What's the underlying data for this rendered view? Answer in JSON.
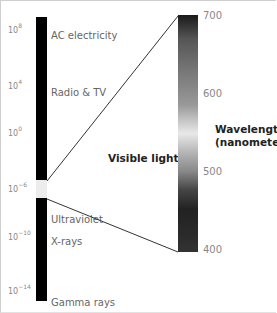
{
  "diagram": {
    "left_scale": {
      "ticks": [
        {
          "base": "10",
          "exp": "8"
        },
        {
          "base": "10",
          "exp": "4"
        },
        {
          "base": "10",
          "exp": "0"
        },
        {
          "base": "10",
          "exp": "−6"
        },
        {
          "base": "10",
          "exp": "−10"
        },
        {
          "base": "10",
          "exp": "−14"
        }
      ],
      "bands": [
        "AC electricity",
        "Radio & TV",
        "Ultraviolet",
        "X-rays",
        "Gamma rays"
      ]
    },
    "visible_label": "Visible light",
    "right_scale": {
      "ticks": [
        "700",
        "600",
        "500",
        "400"
      ],
      "title_line1": "Wavelength",
      "title_line2": "(nanometers)"
    }
  }
}
